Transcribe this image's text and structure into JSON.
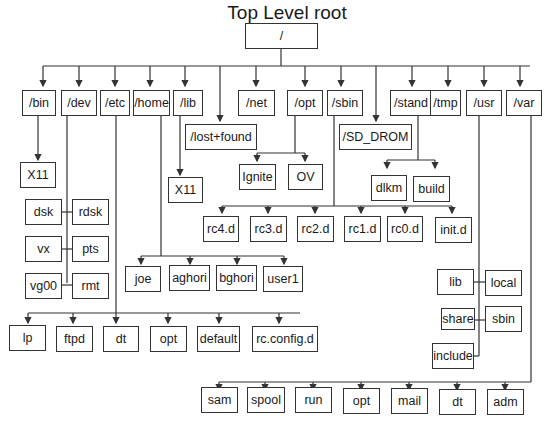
{
  "title": "Top Level root",
  "root": "/",
  "top_level": [
    "/bin",
    "/dev",
    "/etc",
    "/home",
    "/lib",
    "/lost+found",
    "/net",
    "/opt",
    "/sbin",
    "/SD_DROM",
    "/stand",
    "/tmp",
    "/usr",
    "/var"
  ],
  "bin_children": [
    "X11"
  ],
  "lib_children": [
    "X11"
  ],
  "dev_children": [
    "dsk",
    "rdsk",
    "vx",
    "pts",
    "vg00",
    "rmt"
  ],
  "opt_children": [
    "Ignite",
    "OV"
  ],
  "stand_children": [
    "dlkm",
    "build"
  ],
  "sbin_children": [
    "rc4.d",
    "rc3.d",
    "rc2.d",
    "rc1.d",
    "rc0.d",
    "init.d"
  ],
  "home_children": [
    "joe",
    "aghori",
    "bghori",
    "user1"
  ],
  "etc_children": [
    "lp",
    "ftpd",
    "dt",
    "opt",
    "default",
    "rc.config.d"
  ],
  "usr_children": [
    "lib",
    "local",
    "share",
    "sbin",
    "include"
  ],
  "var_children": [
    "sam",
    "spool",
    "run",
    "opt",
    "mail",
    "dt",
    "adm"
  ],
  "colors": {
    "line": "#333333",
    "box_border": "#333333",
    "background": "#ffffff"
  }
}
